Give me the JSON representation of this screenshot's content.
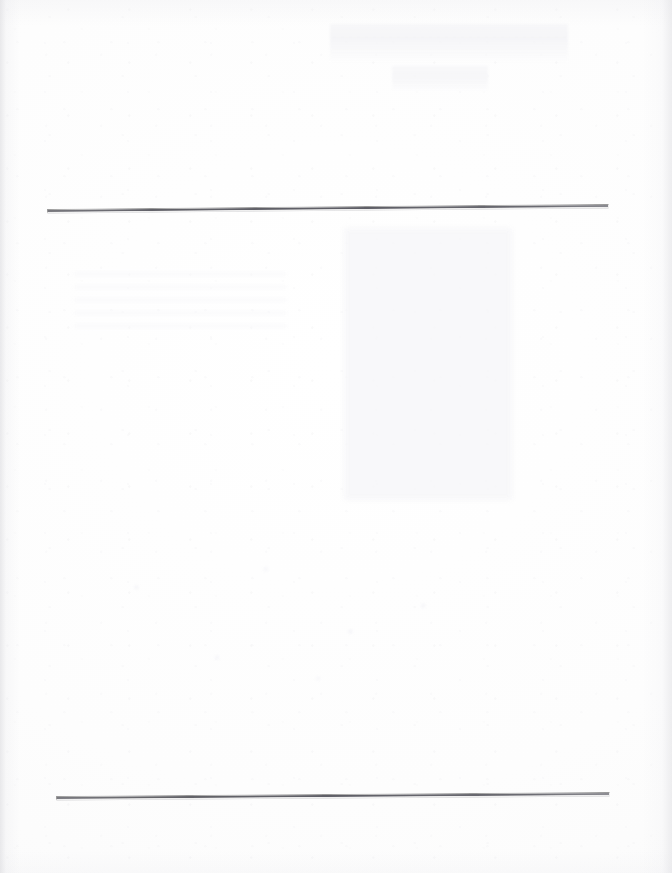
{
  "document": {
    "kind": "scanned-page",
    "page_width": 672,
    "page_height": 873,
    "background_color": "#fdfdfd",
    "visible_text": "",
    "note_label": "blank scanned page"
  },
  "rules": [
    {
      "name": "top-rule",
      "x_start": 47,
      "y_start": 202,
      "x_end": 607,
      "y_end": 197,
      "length": 560,
      "thickness": 2,
      "tilt_degrees": -0.52,
      "color": "#63636a"
    },
    {
      "name": "bottom-rule",
      "x_start": 56,
      "y_start": 789,
      "x_end": 608,
      "y_end": 785,
      "length": 552,
      "thickness": 2,
      "tilt_degrees": -0.42,
      "color": "#64646a"
    }
  ],
  "artifacts": {
    "ghost_heading": {
      "label": "bleed-through-heading",
      "x": 330,
      "y": 24,
      "width": 238,
      "height": 40,
      "color": "#f4f4f7"
    },
    "ghost_subheading": {
      "label": "bleed-through-subheading",
      "x": 392,
      "y": 66,
      "width": 96,
      "height": 26,
      "color": "#f5f5f8"
    },
    "ghost_panel": {
      "label": "bleed-through-block",
      "x": 344,
      "y": 228,
      "width": 168,
      "height": 272,
      "color": "#f6f6f8"
    },
    "ghost_text_left": {
      "label": "bleed-through-text-lines",
      "x": 74,
      "y": 272,
      "width": 212,
      "height": 56,
      "color": "#f8f8fa"
    },
    "speckles": {
      "label": "scan-speckles",
      "x": 96,
      "y": 548,
      "width": 404,
      "height": 152,
      "color": "#f6f6f9"
    },
    "edge_shading": {
      "label": "scan-edge-shadow",
      "left_color": "#d8d8dc",
      "right_color": "#dedee2"
    }
  }
}
